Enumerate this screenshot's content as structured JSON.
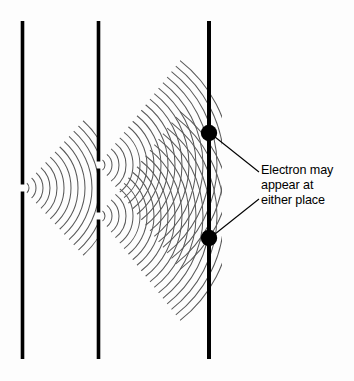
{
  "figure": {
    "kind": "double-slit-interference-diagram",
    "background_color": "#fdfdfd",
    "stroke_color": "#000000",
    "wave_color": "#5a5a5a",
    "width": 354,
    "height": 381
  },
  "barriers": [
    {
      "name": "source-barrier",
      "x": 22.5,
      "y_top": 21,
      "y_bottom": 359,
      "thickness": 3.6,
      "slits": [
        {
          "y": 188,
          "gap": 7
        }
      ]
    },
    {
      "name": "double-slit-barrier",
      "x": 98.5,
      "y_top": 21,
      "y_bottom": 359,
      "thickness": 3.6,
      "slits": [
        {
          "y": 165,
          "gap": 7
        },
        {
          "y": 216,
          "gap": 7
        }
      ]
    },
    {
      "name": "detector-screen",
      "x": 209,
      "y_top": 21,
      "y_bottom": 359,
      "thickness": 4.0,
      "slits": []
    }
  ],
  "wave_sources": [
    {
      "name": "source-slit-wave",
      "origin_x": 22.5,
      "origin_y": 188,
      "arc_count": 13,
      "spacing": 7.0,
      "first_radius": 6.5,
      "half_angle_deg": 48,
      "clip_x_max": 98.5
    },
    {
      "name": "upper-slit-wave",
      "origin_x": 98.5,
      "origin_y": 165,
      "arc_count": 19,
      "spacing": 7.0,
      "first_radius": 6.5,
      "half_angle_deg": 52,
      "clip_x_max": 222
    },
    {
      "name": "lower-slit-wave",
      "origin_x": 98.5,
      "origin_y": 216,
      "arc_count": 19,
      "spacing": 7.0,
      "first_radius": 6.5,
      "half_angle_deg": 52,
      "clip_x_max": 222
    }
  ],
  "electron_dots": [
    {
      "name": "upper-electron-dot",
      "cx": 209,
      "cy": 133,
      "r": 8.2
    },
    {
      "name": "lower-electron-dot",
      "cx": 209,
      "cy": 238,
      "r": 8.2
    }
  ],
  "leader_lines": [
    {
      "name": "upper-leader-line",
      "x1": 215,
      "y1": 137,
      "x2": 259,
      "y2": 172
    },
    {
      "name": "lower-leader-line",
      "x1": 215,
      "y1": 234,
      "x2": 259,
      "y2": 199
    }
  ],
  "annotation": {
    "name": "electron-annotation",
    "lines": [
      "Electron may",
      "appear at",
      "either place"
    ],
    "full_text": "Electron may appear at either place"
  }
}
